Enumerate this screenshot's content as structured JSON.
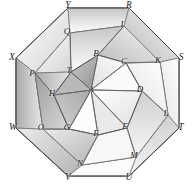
{
  "figure": {
    "kind": "geometric-diagram",
    "shape": "regular-octagon",
    "background_color": "#ffffff",
    "stroke_color": "#4a4a4a",
    "center_label": "A",
    "palette": {
      "lightest": "#fbfbfb",
      "light": "#ededed",
      "mid_light": "#dcdcdc",
      "mid": "#c8c8c8",
      "mid_dark": "#b4b4b4",
      "dark": "#9e9e9e",
      "darkest": "#888888"
    },
    "outer_vertices": [
      {
        "id": "Y",
        "label": "Y",
        "x": 68,
        "y": 6
      },
      {
        "id": "R",
        "label": "R",
        "x": 129,
        "y": 6
      },
      {
        "id": "S",
        "label": "S",
        "x": 181,
        "y": 58
      },
      {
        "id": "T",
        "label": "T",
        "x": 181,
        "y": 128
      },
      {
        "id": "U",
        "label": "U",
        "x": 129,
        "y": 178
      },
      {
        "id": "V",
        "label": "V",
        "x": 68,
        "y": 178
      },
      {
        "id": "W",
        "label": "W",
        "x": 13,
        "y": 128
      },
      {
        "id": "X",
        "label": "X",
        "x": 12,
        "y": 58
      }
    ],
    "mid_vertices": [
      {
        "id": "I",
        "label": "I",
        "x": 122,
        "y": 24
      },
      {
        "id": "K",
        "label": "K",
        "x": 158,
        "y": 60
      },
      {
        "id": "L",
        "label": "L",
        "x": 166,
        "y": 113
      },
      {
        "id": "M",
        "label": "M",
        "x": 134,
        "y": 155
      },
      {
        "id": "N",
        "label": "N",
        "x": 80,
        "y": 163
      },
      {
        "id": "O",
        "label": "O",
        "x": 41,
        "y": 127
      },
      {
        "id": "P",
        "label": "P",
        "x": 32,
        "y": 73
      },
      {
        "id": "Q",
        "label": "Q",
        "x": 67,
        "y": 31
      }
    ],
    "inner_vertices": [
      {
        "id": "B",
        "label": "B",
        "x": 96,
        "y": 53
      },
      {
        "id": "C",
        "label": "C",
        "x": 124,
        "y": 61
      },
      {
        "id": "D",
        "label": "D",
        "x": 140,
        "y": 89
      },
      {
        "id": "E",
        "label": "E",
        "x": 125,
        "y": 126
      },
      {
        "id": "F",
        "label": "F",
        "x": 96,
        "y": 133
      },
      {
        "id": "G",
        "label": "G",
        "x": 67,
        "y": 127
      },
      {
        "id": "H",
        "label": "H",
        "x": 52,
        "y": 93
      },
      {
        "id": "T2",
        "label": "T",
        "x": 69,
        "y": 70
      }
    ],
    "center_vertex": {
      "id": "A",
      "label": "A",
      "x": 91,
      "y": 89
    },
    "notes": {
      "outer_count": 8,
      "mid_count": 8,
      "inner_count": 8
    }
  }
}
